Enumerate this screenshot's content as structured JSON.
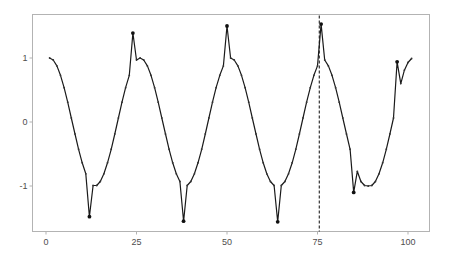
{
  "chart_data": {
    "type": "line",
    "title": "",
    "xlabel": "",
    "ylabel": "",
    "xlim": [
      -4.5,
      106.5
    ],
    "ylim": [
      -1.7,
      1.68
    ],
    "x_ticks": [
      0,
      25,
      50,
      75,
      100
    ],
    "x_tick_labels": [
      "0",
      "25",
      "50",
      "75",
      "100"
    ],
    "y_ticks": [
      -1,
      0,
      1
    ],
    "y_tick_labels": [
      "-1",
      "0",
      "1"
    ],
    "grid": false,
    "legend": null,
    "vline": {
      "x": 75.5,
      "style": "dashed"
    },
    "series": [
      {
        "name": "signal",
        "x": [
          1,
          2,
          3,
          4,
          5,
          6,
          7,
          8,
          9,
          10,
          11,
          12,
          13,
          14,
          15,
          16,
          17,
          18,
          19,
          20,
          21,
          22,
          23,
          24,
          25,
          26,
          27,
          28,
          29,
          30,
          31,
          32,
          33,
          34,
          35,
          36,
          37,
          38,
          39,
          40,
          41,
          42,
          43,
          44,
          45,
          46,
          47,
          48,
          49,
          50,
          51,
          52,
          53,
          54,
          55,
          56,
          57,
          58,
          59,
          60,
          61,
          62,
          63,
          64,
          65,
          66,
          67,
          68,
          69,
          70,
          71,
          72,
          73,
          74,
          75,
          76,
          77,
          78,
          79,
          80,
          81,
          82,
          83,
          84,
          85,
          86,
          87,
          88,
          89,
          90,
          91,
          92,
          93,
          94,
          95,
          96,
          97,
          98,
          99,
          100,
          101
        ],
        "values": [
          1.0,
          0.969,
          0.876,
          0.729,
          0.536,
          0.309,
          0.063,
          -0.187,
          -0.426,
          -0.637,
          -0.809,
          -1.48,
          -0.992,
          -0.992,
          -0.93,
          -0.809,
          -0.637,
          -0.426,
          -0.187,
          0.063,
          0.309,
          0.536,
          0.729,
          1.39,
          0.969,
          1.0,
          0.969,
          0.876,
          0.729,
          0.536,
          0.309,
          0.063,
          -0.187,
          -0.426,
          -0.637,
          -0.809,
          -0.93,
          -1.55,
          -0.992,
          -0.93,
          -0.809,
          -0.637,
          -0.426,
          -0.187,
          0.063,
          0.309,
          0.536,
          0.729,
          0.876,
          1.5,
          1.0,
          0.969,
          0.876,
          0.729,
          0.536,
          0.309,
          0.063,
          -0.187,
          -0.426,
          -0.637,
          -0.809,
          -0.93,
          -0.992,
          -1.56,
          -0.992,
          -0.93,
          -0.809,
          -0.637,
          -0.426,
          -0.187,
          0.063,
          0.309,
          0.536,
          0.729,
          0.876,
          1.53,
          0.969,
          0.876,
          0.729,
          0.536,
          0.309,
          0.063,
          -0.187,
          -0.426,
          -1.1,
          -0.77,
          -0.93,
          -0.992,
          -1.0,
          -0.992,
          -0.93,
          -0.809,
          -0.637,
          -0.426,
          -0.187,
          0.063,
          0.94,
          0.6,
          0.809,
          0.93,
          0.992
        ],
        "outliers_x": [
          12,
          24,
          38,
          50,
          64,
          76,
          85,
          97
        ],
        "color": "#000000"
      }
    ]
  },
  "colors": {
    "line": "#1a1a1a",
    "panel_border": "#b3b3b3",
    "axis_text": "#4d4d4d",
    "vline": "#333333"
  }
}
